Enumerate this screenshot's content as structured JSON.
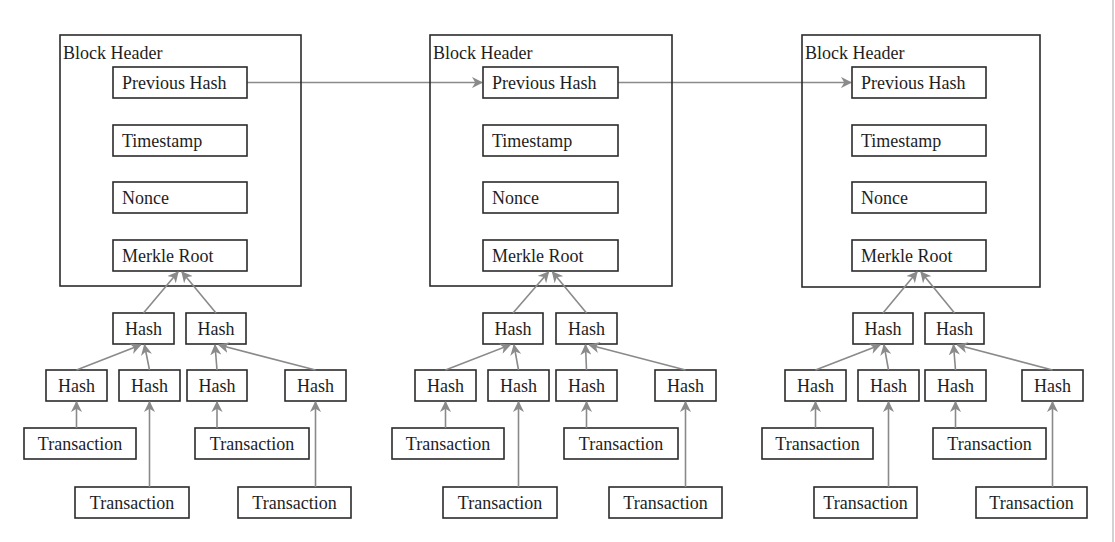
{
  "diagram": {
    "colors": {
      "box_stroke": "#2b2b2b",
      "arrow": "#8a8a8a",
      "text": "#1e1e1e",
      "background": "#ffffff"
    },
    "labels": {
      "block_header": "Block Header",
      "previous_hash": "Previous Hash",
      "timestamp": "Timestamp",
      "nonce": "Nonce",
      "merkle_root": "Merkle Root",
      "hash": "Hash",
      "transaction": "Transaction"
    },
    "blocks": [
      {
        "outer": [
          60,
          35,
          241,
          251
        ],
        "fields_x": [
          113,
          134
        ],
        "level2": [
          [
            113,
            61
          ],
          [
            186,
            60
          ]
        ],
        "level1": [
          [
            46,
            61
          ],
          [
            119,
            61
          ],
          [
            187,
            60
          ],
          [
            285,
            61
          ]
        ],
        "tx": [
          [
            24,
            112,
            428
          ],
          [
            75,
            114,
            487
          ],
          [
            195,
            114,
            428
          ],
          [
            238,
            113,
            487
          ]
        ]
      },
      {
        "outer": [
          430,
          35,
          242,
          251
        ],
        "fields_x": [
          483,
          135
        ],
        "level2": [
          [
            483,
            60
          ],
          [
            556,
            61
          ]
        ],
        "level1": [
          [
            415,
            61
          ],
          [
            488,
            61
          ],
          [
            556,
            61
          ],
          [
            655,
            61
          ]
        ],
        "tx": [
          [
            392,
            112,
            428
          ],
          [
            443,
            114,
            487
          ],
          [
            564,
            114,
            428
          ],
          [
            609,
            113,
            487
          ]
        ]
      },
      {
        "outer": [
          802,
          35,
          238,
          252
        ],
        "fields_x": [
          852,
          134
        ],
        "level2": [
          [
            853,
            60
          ],
          [
            925,
            59
          ]
        ],
        "level1": [
          [
            785,
            61
          ],
          [
            858,
            61
          ],
          [
            925,
            61
          ],
          [
            1022,
            61
          ]
        ],
        "tx": [
          [
            762,
            111,
            428
          ],
          [
            814,
            103,
            487
          ],
          [
            933,
            113,
            428
          ],
          [
            976,
            111,
            487
          ]
        ]
      }
    ],
    "field_rows_y": [
      67,
      125,
      182,
      240
    ],
    "field_height": 31,
    "level2_y": 313,
    "level1_y": 370,
    "node_height": 31
  }
}
